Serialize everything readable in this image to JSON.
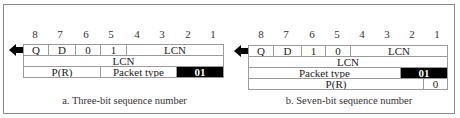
{
  "bit_numbers": [
    "8",
    "7",
    "6",
    "5",
    "4",
    "3",
    "2",
    "1"
  ],
  "figures": [
    {
      "id": "three-bit",
      "caption": "a. Three-bit sequence number",
      "rows": [
        [
          {
            "label": "Q"
          },
          {
            "label": "D"
          },
          {
            "label": "0"
          },
          {
            "label": "1"
          },
          {
            "label": "LCN"
          }
        ],
        [
          {
            "label": "LCN"
          }
        ],
        [
          {
            "label": "P(R)"
          },
          {
            "label": "Packet type"
          },
          {
            "label": "01"
          }
        ]
      ]
    },
    {
      "id": "seven-bit",
      "caption": "b. Seven-bit sequence number",
      "rows": [
        [
          {
            "label": "Q"
          },
          {
            "label": "D"
          },
          {
            "label": "1"
          },
          {
            "label": "0"
          },
          {
            "label": "LCN"
          }
        ],
        [
          {
            "label": "LCN"
          }
        ],
        [
          {
            "label": "Packet type"
          },
          {
            "label": "01"
          }
        ],
        [
          {
            "label": "P(R)"
          },
          {
            "label": "0"
          }
        ]
      ]
    }
  ],
  "colors": {
    "border": "#9a9a9a",
    "highlight_bg": "#000000",
    "highlight_text": "#ffffff"
  }
}
